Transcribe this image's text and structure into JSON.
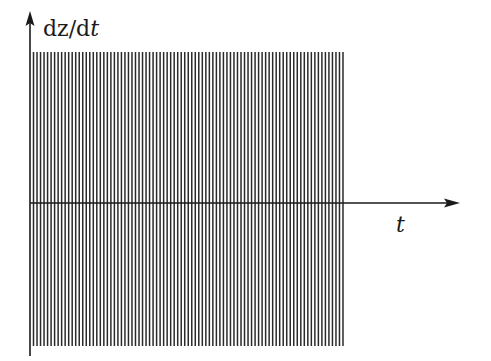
{
  "figure": {
    "y_axis_label": {
      "upright": "dz/d",
      "italic": "t"
    },
    "x_axis_label": "t",
    "y_label_parts": {
      "d1": "d",
      "z": "z",
      "slash_d": "/d",
      "t": "t"
    },
    "colors": {
      "lines": "#2a2a2a",
      "axes": "#1a1a1a",
      "background": "#ffffff"
    }
  },
  "chart_data": {
    "type": "line",
    "title": "",
    "xlabel": "t",
    "ylabel": "dz/dt",
    "x_range": [
      0,
      1
    ],
    "amplitude": 1,
    "ylim": [
      -1.0,
      1.0
    ],
    "num_oscillation_lines": 89,
    "grid": false,
    "legend": null
  }
}
